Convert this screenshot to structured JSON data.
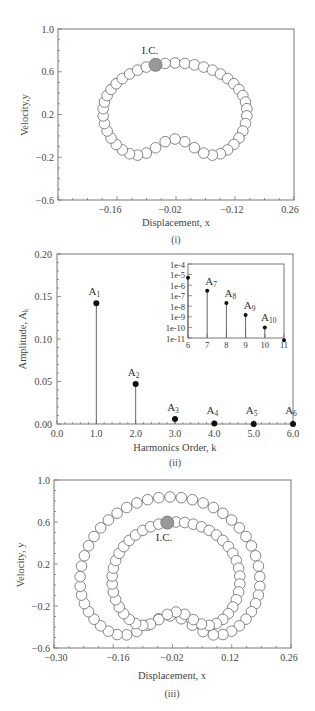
{
  "chart_data": [
    {
      "id": "panel-i",
      "type": "scatter",
      "panel_label": "(i)",
      "title": "",
      "xlabel": "Displacement, x",
      "ylabel": "Velocity,y",
      "x_tick_labels": [
        "-0.16",
        "-0.02",
        "-0.12",
        "0.26"
      ],
      "y_tick_labels": [
        "1.0",
        "0.6",
        "0.2",
        "-0.2",
        "-0.6"
      ],
      "ylim": [
        -0.6,
        1.0
      ],
      "grid": false,
      "annotation": "I.C.",
      "series": [
        {
          "name": "periodic orbit",
          "style": "line with open circle markers",
          "points_description": "single closed kidney-shaped loop; top near y≈0.65, bottom trough near y≈-0.28, dip to y≈-0.17 near x≈0",
          "ic_point": {
            "x": -0.06,
            "y": 0.65
          }
        }
      ]
    },
    {
      "id": "panel-ii",
      "type": "bar",
      "panel_label": "(ii)",
      "title": "",
      "xlabel": "Harmonics Order, k",
      "ylabel": "Amplitude, A_k",
      "x_tick_labels": [
        "0.0",
        "1.0",
        "2.0",
        "3.0",
        "4.0",
        "5.0",
        "6.0"
      ],
      "y_tick_labels": [
        "0.20",
        "0.15",
        "0.10",
        "0.05",
        "0.00"
      ],
      "xlim": [
        0,
        6
      ],
      "ylim": [
        0,
        0.2
      ],
      "grid": false,
      "categories": [
        1,
        2,
        3,
        4,
        5,
        6
      ],
      "labels": [
        "A1",
        "A2",
        "A3",
        "A4",
        "A5",
        "A6"
      ],
      "values": [
        0.142,
        0.047,
        0.006,
        0.0005,
        2e-05,
        5e-06
      ],
      "inset": {
        "type": "stem-log",
        "x_tick_labels": [
          "6",
          "7",
          "8",
          "9",
          "10",
          "11"
        ],
        "y_tick_labels": [
          "1e-4",
          "1e-5",
          "1e-6",
          "1e-7",
          "1e-8",
          "1e-9",
          "1e-10",
          "1e-11"
        ],
        "categories": [
          6,
          7,
          8,
          9,
          10,
          11
        ],
        "labels": [
          "",
          "A7",
          "A8",
          "A9",
          "A10",
          ""
        ],
        "values": [
          5e-06,
          3e-07,
          2e-08,
          1.5e-09,
          1e-10,
          6e-12
        ]
      }
    },
    {
      "id": "panel-iii",
      "type": "scatter",
      "panel_label": "(iii)",
      "title": "",
      "xlabel": "Displacement, x",
      "ylabel": "Velocity, y",
      "x_tick_labels": [
        "-0.30",
        "-0.16",
        "-0.02",
        "0.12",
        "0.26"
      ],
      "y_tick_labels": [
        "1.0",
        "0.6",
        "0.2",
        "-0.2",
        "-0.6"
      ],
      "xlim": [
        -0.3,
        0.26
      ],
      "ylim": [
        -0.6,
        1.0
      ],
      "grid": false,
      "annotation": "I.C.",
      "series": [
        {
          "name": "orbit (double loop)",
          "style": "line with open circle markers",
          "points_description": "two nested kidney-shaped loops; outer top y≈0.82, inner top y≈0.62; troughs near y≈-0.30 and y≈-0.20",
          "ic_point": {
            "x": -0.04,
            "y": 0.6
          }
        }
      ]
    }
  ],
  "panels": {
    "i": {
      "label": "(i)",
      "xlabel": "Displacement, x",
      "ylabel": "Velocity,y",
      "ic": "I.C.",
      "xticks": [
        "-0.16",
        "-0.02",
        "-0.12",
        "0.26"
      ],
      "yticks": [
        "1.0",
        "0.6",
        "0.2",
        "-0.2",
        "-0.6"
      ]
    },
    "ii": {
      "label": "(ii)",
      "xlabel": "Harmonics Order, k",
      "ylabel": "Amplitude, A",
      "ylabel_sub": "k",
      "xticks": [
        "0.0",
        "1.0",
        "2.0",
        "3.0",
        "4.0",
        "5.0",
        "6.0"
      ],
      "yticks": [
        "0.20",
        "0.15",
        "0.10",
        "0.05",
        "0.00"
      ],
      "inset_xticks": [
        "6",
        "7",
        "8",
        "9",
        "10",
        "11"
      ],
      "inset_yticks": [
        "1e-4",
        "1e-5",
        "1e-6",
        "1e-7",
        "1e-8",
        "1e-9",
        "1e-10",
        "1e-11"
      ]
    },
    "iii": {
      "label": "(iii)",
      "xlabel": "Displacement, x",
      "ylabel": "Velocity, y",
      "ic": "I.C.",
      "xticks": [
        "-0.30",
        "-0.16",
        "-0.02",
        "0.12",
        "0.26"
      ],
      "yticks": [
        "1.0",
        "0.6",
        "0.2",
        "-0.2",
        "-0.6"
      ]
    }
  }
}
